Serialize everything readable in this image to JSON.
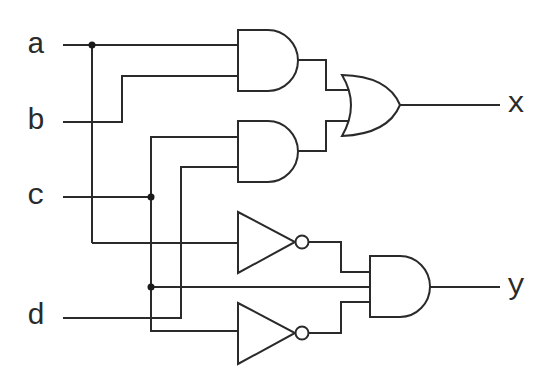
{
  "diagram": {
    "type": "logic-circuit",
    "inputs": [
      {
        "id": "a",
        "label": "a"
      },
      {
        "id": "b",
        "label": "b"
      },
      {
        "id": "c",
        "label": "c"
      },
      {
        "id": "d",
        "label": "d"
      }
    ],
    "outputs": [
      {
        "id": "x",
        "label": "x"
      },
      {
        "id": "y",
        "label": "y"
      }
    ],
    "gates": [
      {
        "id": "and1",
        "type": "AND",
        "inputs": [
          "a",
          "b"
        ]
      },
      {
        "id": "and2",
        "type": "AND",
        "inputs": [
          "c",
          "d"
        ]
      },
      {
        "id": "or1",
        "type": "OR",
        "inputs": [
          "and1",
          "and2"
        ],
        "output": "x"
      },
      {
        "id": "not1",
        "type": "NOT",
        "inputs": [
          "a"
        ]
      },
      {
        "id": "not2",
        "type": "NOT",
        "inputs": [
          "c"
        ]
      },
      {
        "id": "and3",
        "type": "AND",
        "inputs": [
          "not1",
          "c",
          "not2"
        ],
        "output": "y"
      }
    ],
    "colors": {
      "line": "#2a2a2a",
      "background": "#ffffff"
    }
  }
}
